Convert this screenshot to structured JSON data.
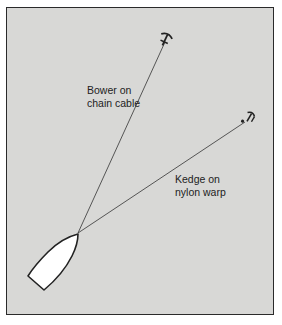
{
  "diagram": {
    "background_color": "#d8d8d6",
    "border_color": "#2a2a2a",
    "labels": {
      "bower": {
        "line1": "Bower on",
        "line2": "chain cable"
      },
      "kedge": {
        "line1": "Kedge on",
        "line2": "nylon warp"
      }
    },
    "elements": {
      "boat": "boat-hull-icon",
      "bower_anchor": "anchor-icon",
      "kedge_anchor": "anchor-icon"
    }
  }
}
